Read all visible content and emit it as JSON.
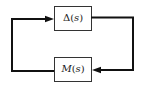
{
  "diagram": {
    "type": "feedback-loop",
    "blocks": [
      {
        "id": "delta",
        "label": "Δ(s)",
        "symbol": "Δ",
        "arg": "s",
        "position": "top"
      },
      {
        "id": "m",
        "label": "M(s)",
        "symbol": "M",
        "arg": "s",
        "position": "bottom"
      }
    ],
    "connections": [
      {
        "from": "delta",
        "to": "m",
        "route": "right side, downward, arrow into M from the right"
      },
      {
        "from": "m",
        "to": "delta",
        "route": "left side, upward, arrow into Δ from the left"
      }
    ],
    "colors": {
      "line": "#111111",
      "box_border": "#333333",
      "background": "#ffffff"
    }
  }
}
